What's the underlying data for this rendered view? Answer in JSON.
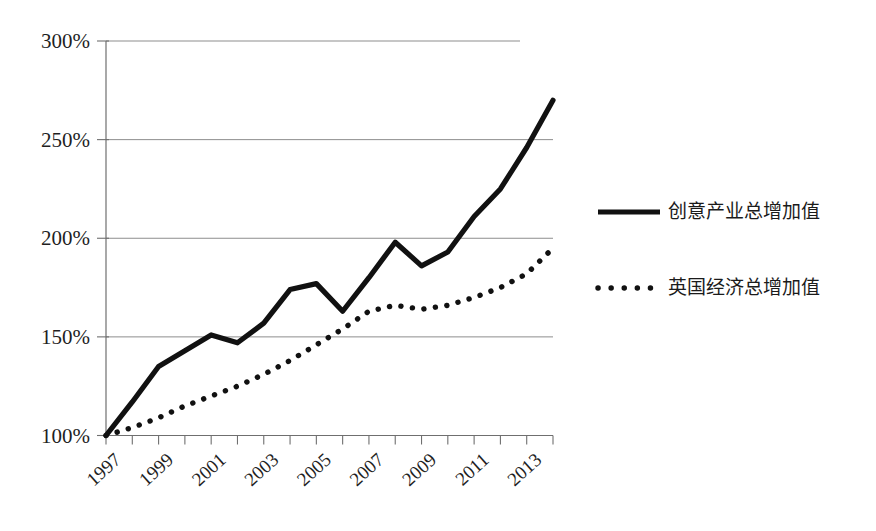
{
  "chart_data": {
    "type": "line",
    "title": "",
    "xlabel": "",
    "ylabel": "",
    "grid": true,
    "legend_position": "right",
    "x": [
      1997,
      1998,
      1999,
      2000,
      2001,
      2002,
      2003,
      2004,
      2005,
      2006,
      2007,
      2008,
      2009,
      2010,
      2011,
      2012,
      2013,
      2014
    ],
    "xlim": [
      1997,
      2014
    ],
    "ylim": [
      100,
      300
    ],
    "ytick_labels": [
      "100%",
      "150%",
      "200%",
      "250%",
      "300%"
    ],
    "ytick_values": [
      100,
      150,
      200,
      250,
      300
    ],
    "xtick_labels": [
      "1997",
      "1999",
      "2001",
      "2003",
      "2005",
      "2007",
      "2009",
      "2011",
      "2013"
    ],
    "xtick_values": [
      1997,
      1999,
      2001,
      2003,
      2005,
      2007,
      2009,
      2011,
      2013
    ],
    "series": [
      {
        "name": "创意产业总增加值",
        "style": "solid",
        "values": [
          100,
          117,
          135,
          143,
          151,
          147,
          157,
          174,
          177,
          163,
          180,
          198,
          186,
          193,
          211,
          225,
          246,
          270
        ]
      },
      {
        "name": "英国经济总增加值",
        "style": "dotted",
        "values": [
          100,
          104,
          109,
          115,
          120,
          125,
          131,
          138,
          146,
          154,
          163,
          166,
          164,
          166,
          170,
          175,
          182,
          195
        ]
      }
    ]
  },
  "legend": {
    "items": [
      {
        "label": "创意产业总增加值",
        "style": "solid"
      },
      {
        "label": "英国经济总增加值",
        "style": "dotted"
      }
    ]
  },
  "axis": {
    "y_labels": [
      "300%",
      "250%",
      "200%",
      "150%",
      "100%"
    ],
    "x_labels": [
      "1997",
      "1999",
      "2001",
      "2003",
      "2005",
      "2007",
      "2009",
      "2011",
      "2013"
    ]
  },
  "colors": {
    "series_line": "#111111",
    "gridline": "#8d8d8d",
    "axis": "#6f6f6f",
    "background": "#ffffff",
    "text": "#1f1f1f"
  }
}
